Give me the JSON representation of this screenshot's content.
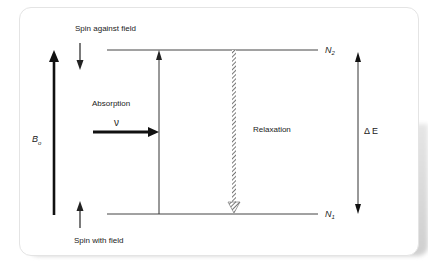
{
  "diagram": {
    "spin_against_field": "Spin against field",
    "spin_with_field": "Spin with field",
    "absorption": "Absorption",
    "nu": "ν",
    "relaxation": "Relaxation",
    "field_label": "B",
    "field_sub": "o",
    "delta_e": "Δ E",
    "upper_level": "N",
    "upper_sub": "2",
    "lower_level": "N",
    "lower_sub": "1"
  }
}
